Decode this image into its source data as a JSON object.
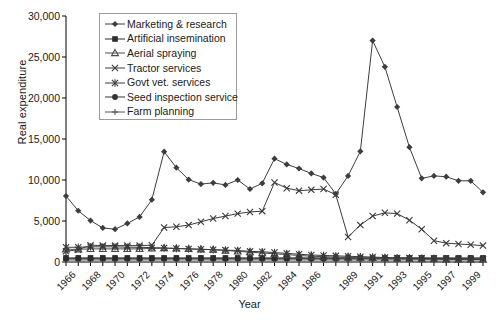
{
  "chart_data": {
    "type": "line",
    "title": "",
    "xlabel": "Year",
    "ylabel": "Real expenditure",
    "ylim": [
      0,
      30000
    ],
    "ytick_values": [
      0,
      5000,
      10000,
      15000,
      20000,
      25000,
      30000
    ],
    "ytick_labels": [
      "0",
      "5,000",
      "10,000",
      "15,000",
      "20,000",
      "25,000",
      "30,000"
    ],
    "grid": false,
    "legend_position": "top-left-inside",
    "x": [
      1966,
      1967,
      1968,
      1969,
      1970,
      1971,
      1972,
      1973,
      1974,
      1975,
      1976,
      1977,
      1978,
      1979,
      1980,
      1981,
      1982,
      1983,
      1984,
      1985,
      1986,
      1987,
      1988,
      1989,
      1990,
      1991,
      1992,
      1993,
      1994,
      1995,
      1996,
      1997,
      1998,
      1999,
      2000
    ],
    "xtick_labels": [
      "1966",
      "1968",
      "1970",
      "1972",
      "1974",
      "1976",
      "1978",
      "1980",
      "1982",
      "1984",
      "1986",
      "1989",
      "1991",
      "1993",
      "1995",
      "1997",
      "1999"
    ],
    "xtick_label_years": [
      1966,
      1968,
      1970,
      1972,
      1974,
      1976,
      1978,
      1980,
      1982,
      1984,
      1986,
      1989,
      1991,
      1993,
      1995,
      1997,
      1999
    ],
    "series": [
      {
        "name": "Marketing & research",
        "marker": "diamond",
        "color": "#3d3d3d",
        "values": [
          8050,
          6250,
          5050,
          4150,
          4000,
          4700,
          5500,
          7600,
          13450,
          11500,
          10050,
          9500,
          9650,
          9400,
          10000,
          8900,
          9600,
          12600,
          11900,
          11400,
          10800,
          10300,
          8300,
          10500,
          13500,
          27000,
          23800,
          18900,
          14000,
          10200,
          10500,
          10400,
          9900,
          9900,
          8500
        ]
      },
      {
        "name": "Artificial insemination",
        "marker": "square",
        "color": "#2b2b2b",
        "values": [
          500,
          500,
          500,
          500,
          500,
          500,
          500,
          500,
          500,
          500,
          500,
          500,
          500,
          500,
          500,
          500,
          500,
          500,
          500,
          500,
          500,
          500,
          500,
          500,
          500,
          500,
          500,
          500,
          500,
          500,
          500,
          500,
          500,
          500,
          500
        ]
      },
      {
        "name": "Aerial spraying",
        "marker": "triangle",
        "color": "#4a4a4a",
        "values": [
          1550,
          1550,
          1600,
          1600,
          1600,
          1600,
          1600,
          1650,
          1700,
          1650,
          1600,
          1550,
          1500,
          1400,
          1300,
          1200,
          1100,
          1000,
          900,
          800,
          700,
          650,
          600,
          550,
          500,
          500,
          450,
          400,
          400,
          350,
          350,
          300,
          300,
          300,
          300
        ]
      },
      {
        "name": "Tractor services",
        "marker": "x",
        "color": "#3a3a3a",
        "values": [
          1300,
          1500,
          2050,
          2000,
          2000,
          2000,
          2000,
          2050,
          4200,
          4300,
          4500,
          4900,
          5300,
          5600,
          5900,
          6100,
          6200,
          9700,
          9000,
          8700,
          8800,
          8900,
          8200,
          3050,
          4500,
          5600,
          6000,
          5900,
          5100,
          4000,
          2600,
          2300,
          2200,
          2100,
          2000
        ]
      },
      {
        "name": "Govt vet. services",
        "marker": "star",
        "color": "#3a3a3a",
        "values": [
          1800,
          1800,
          1850,
          1850,
          1850,
          1800,
          1800,
          1750,
          1700,
          1650,
          1600,
          1550,
          1500,
          1450,
          1400,
          1300,
          1250,
          1150,
          1050,
          950,
          850,
          800,
          750,
          700,
          650,
          600,
          550,
          500,
          480,
          450,
          420,
          400,
          380,
          360,
          350
        ]
      },
      {
        "name": "Seed inspection service",
        "marker": "circle",
        "color": "#333333",
        "values": [
          400,
          400,
          400,
          400,
          400,
          400,
          400,
          400,
          400,
          400,
          400,
          400,
          400,
          400,
          400,
          400,
          400,
          400,
          400,
          400,
          400,
          400,
          400,
          400,
          400,
          400,
          400,
          400,
          400,
          400,
          400,
          400,
          400,
          400,
          400
        ]
      },
      {
        "name": "Farm planning",
        "marker": "plus",
        "color": "#555555",
        "values": [
          250,
          250,
          250,
          250,
          250,
          250,
          250,
          250,
          250,
          250,
          250,
          250,
          250,
          250,
          250,
          250,
          250,
          250,
          250,
          250,
          250,
          250,
          250,
          250,
          250,
          250,
          250,
          250,
          250,
          250,
          250,
          250,
          250,
          250,
          250
        ]
      }
    ]
  },
  "legend": {
    "items": [
      {
        "label": "Marketing & research",
        "marker": "diamond"
      },
      {
        "label": "Artificial insemination",
        "marker": "square"
      },
      {
        "label": "Aerial spraying",
        "marker": "triangle"
      },
      {
        "label": "Tractor services",
        "marker": "x"
      },
      {
        "label": "Govt vet. services",
        "marker": "star"
      },
      {
        "label": "Seed inspection service",
        "marker": "circle"
      },
      {
        "label": "Farm planning",
        "marker": "plus"
      }
    ]
  }
}
